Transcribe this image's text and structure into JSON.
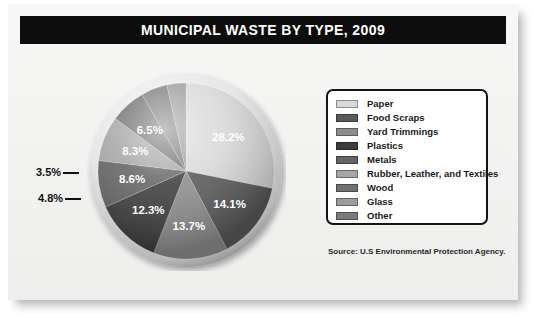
{
  "title": "MUNICIPAL WASTE BY TYPE, 2009",
  "source": {
    "label": "Source:",
    "text": "U.S Environmental Protection Agency."
  },
  "legend": {
    "items": [
      {
        "label": "Paper",
        "color": "#d9d9d9"
      },
      {
        "label": "Food Scraps",
        "color": "#5a5a5a"
      },
      {
        "label": "Yard Trimmings",
        "color": "#8d8d8d"
      },
      {
        "label": "Plastics",
        "color": "#3d3d3d"
      },
      {
        "label": "Metals",
        "color": "#646464"
      },
      {
        "label": "Rubber, Leather, and Textiles",
        "color": "#a6a6a6"
      },
      {
        "label": "Wood",
        "color": "#707070"
      },
      {
        "label": "Glass",
        "color": "#9b9b9b"
      },
      {
        "label": "Other",
        "color": "#7b7b7b"
      }
    ]
  },
  "chart_data": {
    "type": "pie",
    "title": "MUNICIPAL WASTE BY TYPE, 2009",
    "legend_position": "right",
    "unit": "percent",
    "categories": [
      "Paper",
      "Food Scraps",
      "Yard Trimmings",
      "Plastics",
      "Metals",
      "Rubber, Leather, and Textiles",
      "Wood",
      "Other",
      "Glass"
    ],
    "values": [
      28.2,
      14.1,
      13.7,
      12.3,
      8.6,
      8.3,
      6.5,
      4.8,
      3.5
    ],
    "colors": [
      "#d9d9d9",
      "#5a5a5a",
      "#8d8d8d",
      "#3d3d3d",
      "#646464",
      "#a6a6a6",
      "#707070",
      "#7b7b7b",
      "#9b9b9b"
    ],
    "slices": [
      {
        "label": "Paper",
        "value": 28.2,
        "display": "28.2%",
        "color": "#d9d9d9",
        "label_placement": "inside"
      },
      {
        "label": "Food Scraps",
        "value": 14.1,
        "display": "14.1%",
        "color": "#5a5a5a",
        "label_placement": "inside"
      },
      {
        "label": "Yard Trimmings",
        "value": 13.7,
        "display": "13.7%",
        "color": "#8d8d8d",
        "label_placement": "inside"
      },
      {
        "label": "Plastics",
        "value": 12.3,
        "display": "12.3%",
        "color": "#3d3d3d",
        "label_placement": "inside"
      },
      {
        "label": "Metals",
        "value": 8.6,
        "display": "8.6%",
        "color": "#646464",
        "label_placement": "inside"
      },
      {
        "label": "Rubber, Leather, and Textiles",
        "value": 8.3,
        "display": "8.3%",
        "color": "#a6a6a6",
        "label_placement": "inside"
      },
      {
        "label": "Wood",
        "value": 6.5,
        "display": "6.5%",
        "color": "#707070",
        "label_placement": "inside"
      },
      {
        "label": "Other",
        "value": 4.8,
        "display": "4.8%",
        "color": "#7b7b7b",
        "label_placement": "callout-left"
      },
      {
        "label": "Glass",
        "value": 3.5,
        "display": "3.5%",
        "color": "#9b9b9b",
        "label_placement": "callout-left"
      }
    ]
  }
}
